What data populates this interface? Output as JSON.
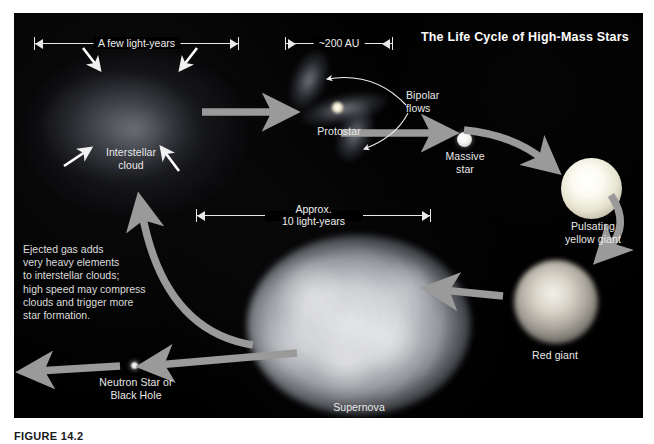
{
  "figure": {
    "caption": "FIGURE 14.2",
    "title": "The Life Cycle of High-Mass Stars"
  },
  "colors": {
    "panel_background": "#000000",
    "arrow_gray": "#9a9a9a",
    "label_text": "#e9e9e9",
    "title_text": "#ffffff",
    "scale_bar": "#e8e8e8",
    "caption_text": "#1a1a1a"
  },
  "scales": [
    {
      "id": "a-few-light-years",
      "label": "A few light-years"
    },
    {
      "id": "200-au",
      "label": "~200 AU"
    },
    {
      "id": "approx-10-light-years",
      "label": "Approx.\n10 light-years"
    }
  ],
  "stages": [
    {
      "id": "interstellar-cloud",
      "label": "Interstellar\ncloud"
    },
    {
      "id": "protostar",
      "label": "Protostar"
    },
    {
      "id": "bipolar-flows",
      "label": "Bipolar\nflows"
    },
    {
      "id": "massive-star",
      "label": "Massive\nstar"
    },
    {
      "id": "pulsating-yellow-giant",
      "label": "Pulsating\nyellow giant"
    },
    {
      "id": "red-giant",
      "label": "Red giant"
    },
    {
      "id": "supernova",
      "label": "Supernova"
    },
    {
      "id": "neutron-star-or-black-hole",
      "label": "Neutron Star or\nBlack Hole"
    }
  ],
  "annotation": {
    "ejected_gas": "Ejected gas adds\nvery heavy elements\nto interstellar clouds;\nhigh speed may compress\nclouds and trigger more\nstar formation."
  }
}
